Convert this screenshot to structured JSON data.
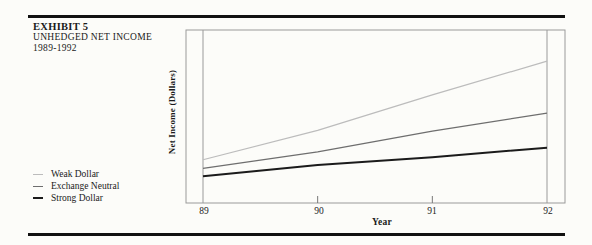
{
  "exhibit": {
    "label": "EXHIBIT 5",
    "title": "UNHEDGED NET INCOME",
    "years": "1989-1992"
  },
  "chart_data": {
    "type": "line",
    "title": "Unhedged Net Income 1989-1992",
    "xlabel": "Year",
    "ylabel": "Net Income (Dollars)",
    "x_tick_labels": [
      "89",
      "90",
      "91",
      "92"
    ],
    "x": [
      1989,
      1990,
      1991,
      1992
    ],
    "y_axis_numeric_labels": false,
    "values_note": "y-axis shows no numeric scale; values are relative plot heights (0 = x-axis, 1 = plot top)",
    "series": [
      {
        "name": "Weak Dollar",
        "color": "#bcbcbc",
        "stroke_width": 1.2,
        "values": [
          0.25,
          0.42,
          0.625,
          0.82
        ]
      },
      {
        "name": "Exchange Neutral",
        "color": "#6e6e6e",
        "stroke_width": 1.3,
        "values": [
          0.2,
          0.295,
          0.415,
          0.52
        ]
      },
      {
        "name": "Strong Dollar",
        "color": "#1b1b1b",
        "stroke_width": 2.0,
        "values": [
          0.155,
          0.22,
          0.265,
          0.32
        ]
      }
    ],
    "frame_color": "#9a9a9a",
    "full_gridline_indices": [
      0,
      3
    ],
    "tick_indices": [
      1,
      2
    ],
    "legend_position": "outside-left-bottom",
    "grid": "vertical lines at first and last year only"
  },
  "legend": {
    "items": [
      {
        "label": "Weak Dollar"
      },
      {
        "label": "Exchange Neutral"
      },
      {
        "label": "Strong Dollar"
      }
    ]
  }
}
